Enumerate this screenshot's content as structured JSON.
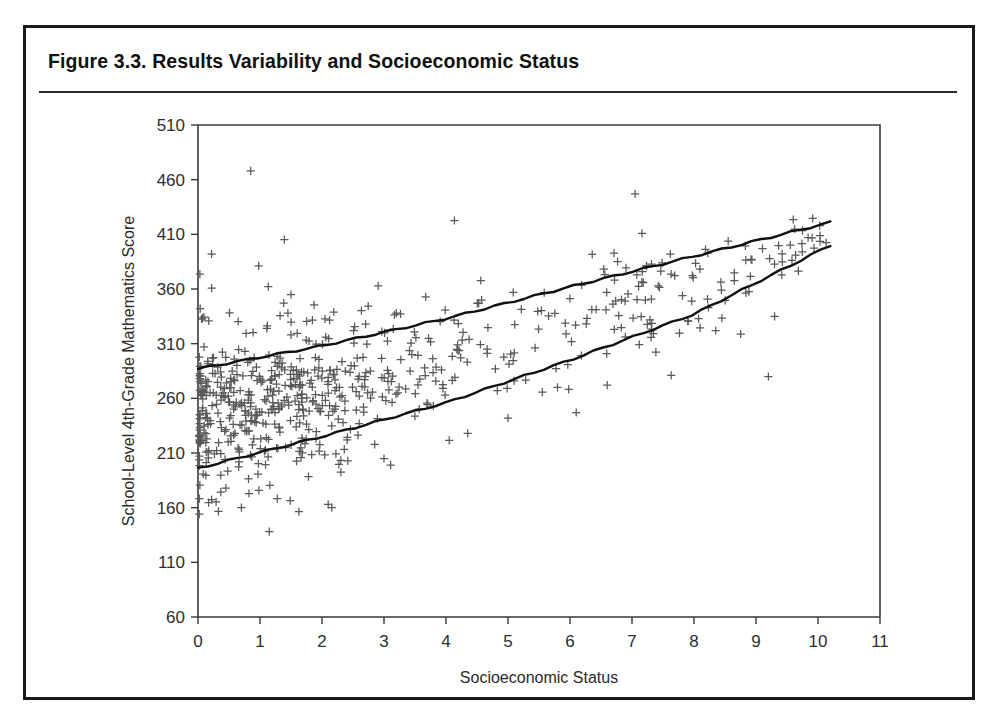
{
  "figure": {
    "title": "Figure 3.3.  Results Variability and Socioeconomic Status",
    "border_color": "#1a1a1a",
    "rule_color": "#2b2b2b"
  },
  "chart_data": {
    "type": "scatter",
    "title": "Figure 3.3.  Results Variability and Socioeconomic Status",
    "xlabel": "Socioeconomic Status",
    "ylabel": "School-Level 4th-Grade Mathematics Score",
    "xlim": [
      0,
      11
    ],
    "ylim": [
      60,
      510
    ],
    "xticks": [
      0,
      1,
      2,
      3,
      4,
      5,
      6,
      7,
      8,
      9,
      10,
      11
    ],
    "xtick_labels": [
      "0",
      "1",
      "2",
      "3",
      "4",
      "5",
      "6",
      "7",
      "8",
      "9",
      "10",
      "11"
    ],
    "yticks": [
      60,
      110,
      160,
      210,
      260,
      310,
      360,
      410,
      460,
      510
    ],
    "ytick_labels": [
      "60",
      "110",
      "160",
      "210",
      "260",
      "310",
      "360",
      "410",
      "460",
      "510"
    ],
    "grid": false,
    "legend": null,
    "marker": "plus",
    "marker_color": "#595959",
    "point_count": 660,
    "series": [
      {
        "name": "Schools",
        "description": "School-level 4th-grade mathematics score plotted against socioeconomic status index",
        "n": 660,
        "x_range": [
          0.02,
          10.25
        ],
        "y_range": [
          135,
          468
        ],
        "cluster_center": [
          1.4,
          262
        ],
        "trend": "positive"
      }
    ],
    "annotations": [
      {
        "name": "upper-band-line",
        "type": "line",
        "description": "Upper boundary line of the central score band",
        "points": [
          [
            0.0,
            287
          ],
          [
            2.0,
            308
          ],
          [
            4.0,
            333
          ],
          [
            6.0,
            362
          ],
          [
            8.0,
            390
          ],
          [
            10.2,
            421
          ]
        ]
      },
      {
        "name": "lower-band-line",
        "type": "line",
        "description": "Lower boundary line of the central score band",
        "points": [
          [
            0.0,
            196
          ],
          [
            2.0,
            225
          ],
          [
            4.0,
            256
          ],
          [
            6.0,
            295
          ],
          [
            8.0,
            337
          ],
          [
            10.2,
            400
          ]
        ]
      }
    ]
  },
  "axes": {
    "x_title": "Socioeconomic Status",
    "y_title": "School-Level 4th-Grade Mathematics Score"
  }
}
